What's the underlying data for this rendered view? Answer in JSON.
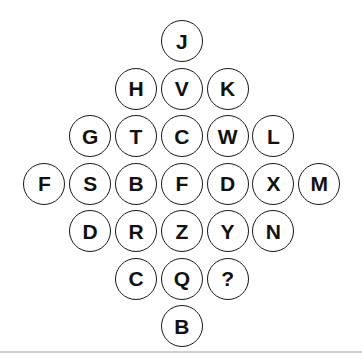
{
  "puzzle": {
    "type": "letter-diamond",
    "rows": [
      [
        "J"
      ],
      [
        "H",
        "V",
        "K"
      ],
      [
        "G",
        "T",
        "C",
        "W",
        "L"
      ],
      [
        "F",
        "S",
        "B",
        "F",
        "D",
        "X",
        "M"
      ],
      [
        "D",
        "R",
        "Z",
        "Y",
        "N"
      ],
      [
        "C",
        "Q",
        "?"
      ],
      [
        "B"
      ]
    ],
    "missing_marker": "?"
  }
}
